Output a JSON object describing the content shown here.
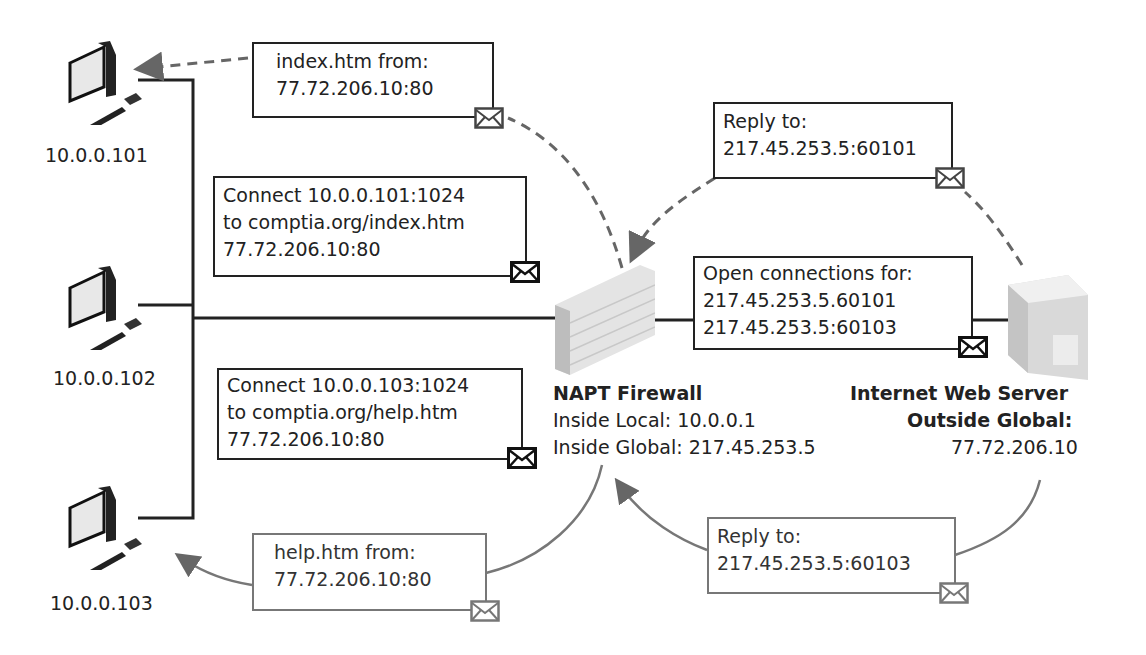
{
  "clients": [
    {
      "ip": "10.0.0.101"
    },
    {
      "ip": "10.0.0.102"
    },
    {
      "ip": "10.0.0.103"
    }
  ],
  "firewall": {
    "title": "NAPT Firewall",
    "inside_local": "Inside Local: 10.0.0.1",
    "inside_global": "Inside Global: 217.45.253.5"
  },
  "server": {
    "title": "Internet Web Server",
    "subtitle": "Outside Global:",
    "ip": "77.72.206.10"
  },
  "messages": {
    "index_from": [
      "index.htm from:",
      "77.72.206.10:80"
    ],
    "connect_101": [
      "Connect 10.0.0.101:1024",
      "to comptia.org/index.htm",
      "77.72.206.10:80"
    ],
    "connect_103": [
      "Connect 10.0.0.103:1024",
      "to comptia.org/help.htm",
      "77.72.206.10:80"
    ],
    "help_from": [
      "help.htm from:",
      "77.72.206.10:80"
    ],
    "reply_60101": [
      "Reply to:",
      "217.45.253.5:60101"
    ],
    "open_connections": [
      "Open connections for:",
      "217.45.253.5.60101",
      "217.45.253.5:60103"
    ],
    "reply_60103": [
      "Reply to:",
      "217.45.253.5:60103"
    ]
  },
  "icons": {
    "client": "desktop-computer-icon",
    "firewall": "brick-wall-icon",
    "server": "server-tower-icon",
    "message": "envelope-icon"
  },
  "colors": {
    "line": "#222222",
    "reply_arrow": "#777777",
    "grey_box": "#777777"
  }
}
